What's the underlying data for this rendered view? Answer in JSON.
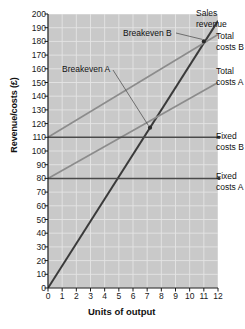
{
  "chart_data": {
    "type": "line",
    "title": "",
    "xlabel": "Units of output",
    "ylabel": "Revenue/costs (£)",
    "xlim": [
      0,
      12
    ],
    "ylim": [
      0,
      200
    ],
    "grid": true,
    "legend_position": "right-inline-labels",
    "xticks": [
      "0",
      "1",
      "2",
      "3",
      "4",
      "5",
      "6",
      "7",
      "8",
      "9",
      "10",
      "11",
      "12"
    ],
    "yticks": [
      "0",
      "10",
      "20",
      "30",
      "40",
      "50",
      "60",
      "70",
      "80",
      "90",
      "100",
      "110",
      "120",
      "130",
      "140",
      "150",
      "160",
      "170",
      "180",
      "190",
      "200"
    ],
    "series": [
      {
        "name": "Sales revenue",
        "color": "#3a3a3a",
        "points": [
          [
            0,
            0
          ],
          [
            12,
            195
          ]
        ]
      },
      {
        "name": "Total costs B",
        "color": "#8c8c8c",
        "points": [
          [
            0,
            110
          ],
          [
            12,
            185
          ]
        ]
      },
      {
        "name": "Total costs A",
        "color": "#8c8c8c",
        "points": [
          [
            0,
            80
          ],
          [
            12,
            150
          ]
        ]
      },
      {
        "name": "Fixed costs B",
        "color": "#4a4a4a",
        "points": [
          [
            0,
            110
          ],
          [
            12,
            110
          ]
        ]
      },
      {
        "name": "Fixed costs A",
        "color": "#4a4a4a",
        "points": [
          [
            0,
            80
          ],
          [
            12,
            80
          ]
        ]
      }
    ],
    "annotations": [
      {
        "name": "Breakeven A",
        "x": 7.2,
        "y": 117
      },
      {
        "name": "Breakeven B",
        "x": 11.0,
        "y": 180
      }
    ]
  },
  "axes": {
    "y_title": "Revenue/costs (£)",
    "x_title": "Units of output"
  },
  "labels": {
    "breakeven_a": "Breakeven A",
    "breakeven_b": "Breakeven B",
    "sales_revenue": "Sales\nrevenue",
    "total_costs_b": "Total\ncosts B",
    "total_costs_a": "Total\ncosts A",
    "fixed_costs_b": "Fixed\ncosts B",
    "fixed_costs_a": "Fixed\ncosts A"
  },
  "colors": {
    "plot_background": "#c9c9c9",
    "grid": "#e4e4e4",
    "axis": "#1a1a1a",
    "sales_revenue": "#3a3a3a",
    "total_costs": "#8c8c8c",
    "fixed_costs": "#4a4a4a"
  }
}
